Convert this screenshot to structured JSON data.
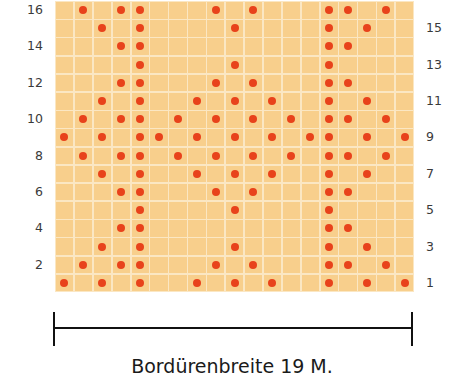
{
  "chart_data": {
    "type": "heatmap",
    "title": "",
    "columns": 19,
    "rows": 16,
    "cell_color": "#f8cf8c",
    "grid_color": "#fbe7c3",
    "dot_color": "#e8421b",
    "left_row_labels": [
      "16",
      "14",
      "12",
      "10",
      "8",
      "6",
      "4",
      "2"
    ],
    "right_row_labels": [
      "15",
      "13",
      "11",
      "9",
      "7",
      "5",
      "3",
      "1"
    ],
    "dots_by_row": {
      "1": [
        0,
        2,
        4,
        7,
        9,
        11,
        14,
        16,
        18
      ],
      "2": [
        1,
        3,
        4,
        8,
        10,
        14,
        15,
        17
      ],
      "3": [
        2,
        4,
        9,
        14,
        16
      ],
      "4": [
        3,
        4,
        14,
        15
      ],
      "5": [
        4,
        9,
        14
      ],
      "6": [
        3,
        4,
        8,
        10,
        14,
        15
      ],
      "7": [
        2,
        4,
        7,
        9,
        11,
        14,
        16
      ],
      "8": [
        1,
        3,
        4,
        6,
        8,
        10,
        12,
        14,
        15,
        17
      ],
      "9": [
        0,
        2,
        4,
        5,
        7,
        9,
        11,
        13,
        14,
        16,
        18
      ],
      "10": [
        1,
        3,
        4,
        6,
        8,
        10,
        12,
        14,
        15,
        17
      ],
      "11": [
        2,
        4,
        7,
        9,
        11,
        14,
        16
      ],
      "12": [
        3,
        4,
        8,
        10,
        14,
        15
      ],
      "13": [
        4,
        9,
        14
      ],
      "14": [
        3,
        4,
        14,
        15
      ],
      "15": [
        2,
        4,
        9,
        14,
        16
      ],
      "16": [
        1,
        3,
        4,
        8,
        10,
        14,
        15,
        17
      ]
    },
    "xlabel": "Bordürenbreite 19 M."
  },
  "caption": "Bordürenbreite 19 M."
}
